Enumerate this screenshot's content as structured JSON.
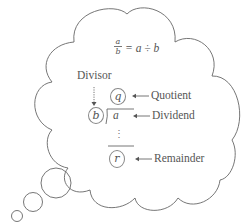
{
  "diagram": {
    "title_equation": {
      "numerator": "a",
      "denominator": "b",
      "rhs": "= a ÷ b"
    },
    "divisor_label": "Divisor",
    "quotient": {
      "symbol": "q",
      "label": "Quotient"
    },
    "divisor_symbol": "b",
    "dividend": {
      "symbol": "a",
      "label": "Dividend"
    },
    "ellipsis": "⋮",
    "remainder": {
      "symbol": "r",
      "label": "Remainder"
    },
    "shape": "thought-cloud",
    "colors": {
      "stroke": "#666666",
      "text": "#555555",
      "background": "#ffffff"
    }
  }
}
